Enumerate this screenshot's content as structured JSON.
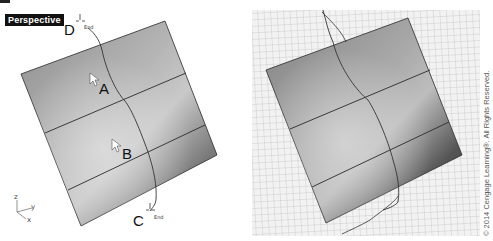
{
  "left_viewport": {
    "title": "Perspective",
    "points": {
      "A": "A",
      "B": "B",
      "C": "C",
      "D": "D"
    },
    "end_markers": [
      "End",
      "End"
    ],
    "axes": {
      "z": "z",
      "y": "y",
      "x": "x"
    }
  },
  "right_viewport": {
    "grid": true
  },
  "copyright": "© 2014 Cengage Learning®. All Rights Reserved.",
  "colors": {
    "viewport_label_bg": "#111111",
    "surface_light": "#c8c8c8",
    "surface_dark": "#5a5a5a",
    "grid_line": "#c8c8c8",
    "edge": "#2a2a2a"
  }
}
